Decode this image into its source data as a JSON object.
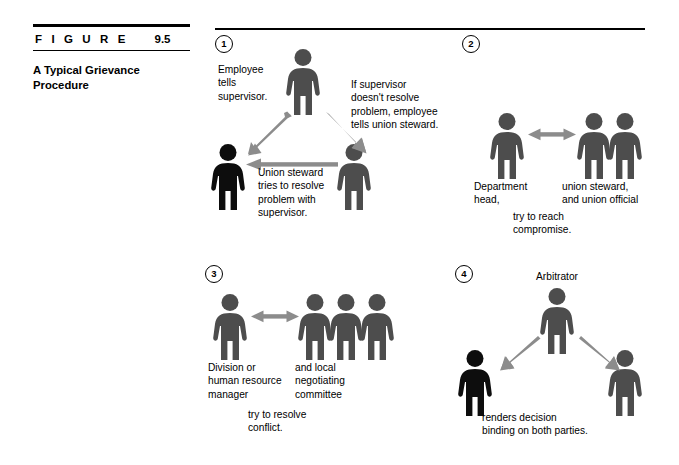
{
  "figure": {
    "label_word": "F I G U R E",
    "number": "9.5",
    "title": "A Typical Grievance\nProcedure"
  },
  "colors": {
    "person_gray": "#4d4d4d",
    "person_black": "#0d0d0d",
    "arrow_gray": "#8c8c8c",
    "rule_black": "#000000",
    "text_black": "#000000"
  },
  "panels": [
    {
      "step": "1",
      "notes": [
        {
          "name": "employee-tells-supervisor-note",
          "text": "Employee\ntells\nsupervisor."
        },
        {
          "name": "if-supervisor-note",
          "text": "If supervisor\ndoesn't resolve\nproblem, employee\ntells union steward."
        },
        {
          "name": "union-steward-resolve-note",
          "text": "Union steward\ntries to resolve\nproblem with\nsupervisor."
        }
      ],
      "people": [
        {
          "name": "person-employee",
          "shade": "gray"
        },
        {
          "name": "person-supervisor",
          "shade": "black"
        },
        {
          "name": "person-union-steward",
          "shade": "gray"
        }
      ],
      "arrows": [
        {
          "name": "arrow-employee-to-supervisor",
          "direction": "single"
        },
        {
          "name": "arrow-employee-to-steward",
          "direction": "single"
        },
        {
          "name": "arrow-steward-to-supervisor",
          "direction": "single"
        }
      ]
    },
    {
      "step": "2",
      "notes": [
        {
          "name": "department-head-note",
          "text": "Department\nhead,"
        },
        {
          "name": "union-steward-official-note",
          "text": "union steward,\nand union official"
        },
        {
          "name": "try-to-reach-compromise-note",
          "text": "try to reach\ncompromise."
        }
      ],
      "people": [
        {
          "name": "person-department-head",
          "shade": "gray"
        },
        {
          "name": "person-union-steward",
          "shade": "gray"
        },
        {
          "name": "person-union-official",
          "shade": "gray"
        }
      ],
      "arrows": [
        {
          "name": "arrow-head-to-union-double",
          "direction": "double"
        }
      ]
    },
    {
      "step": "3",
      "notes": [
        {
          "name": "division-hr-manager-note",
          "text": "Division or\nhuman resource\nmanager"
        },
        {
          "name": "local-negotiating-committee-note",
          "text": "and local\nnegotiating\ncommittee"
        },
        {
          "name": "try-to-resolve-conflict-note",
          "text": "try to resolve\nconflict."
        }
      ],
      "people": [
        {
          "name": "person-division-manager",
          "shade": "gray"
        },
        {
          "name": "person-committee-member-1",
          "shade": "gray"
        },
        {
          "name": "person-committee-member-2",
          "shade": "gray"
        },
        {
          "name": "person-committee-member-3",
          "shade": "gray"
        }
      ],
      "arrows": [
        {
          "name": "arrow-manager-to-committee-double",
          "direction": "double"
        }
      ]
    },
    {
      "step": "4",
      "notes": [
        {
          "name": "arbitrator-label",
          "text": "Arbitrator"
        },
        {
          "name": "renders-decision-note",
          "text": "renders decision\nbinding on both parties."
        }
      ],
      "people": [
        {
          "name": "person-arbitrator",
          "shade": "gray"
        },
        {
          "name": "person-party-left",
          "shade": "black"
        },
        {
          "name": "person-party-right",
          "shade": "gray"
        }
      ],
      "arrows": [
        {
          "name": "arrow-arbitrator-to-left-party",
          "direction": "single"
        },
        {
          "name": "arrow-arbitrator-to-right-party",
          "direction": "single"
        }
      ]
    }
  ]
}
